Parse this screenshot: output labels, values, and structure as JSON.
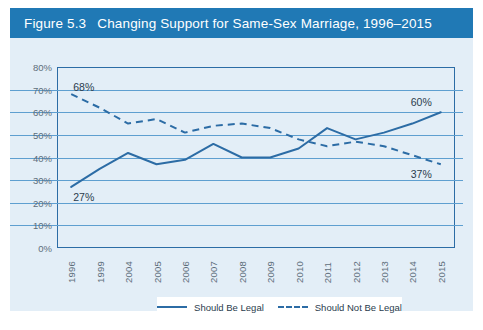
{
  "figure": {
    "number": "Figure 5.3",
    "title": "Changing Support for Same-Sex Marriage, 1996–2015",
    "title_bar_color": "#2079b5",
    "panel_bg_color": "#e3eef7",
    "accent_color": "#2c6ca5",
    "gridline_color": "#5e9fd0"
  },
  "chart_data": {
    "type": "line",
    "title": "Changing Support for Same-Sex Marriage, 1996–2015",
    "xlabel": "",
    "ylabel": "",
    "ylim": [
      0,
      80
    ],
    "ytick_labels": [
      "80%",
      "70%",
      "60%",
      "50%",
      "40%",
      "30%",
      "20%",
      "10%",
      "0%"
    ],
    "ytick_values": [
      80,
      70,
      60,
      50,
      40,
      30,
      20,
      10,
      0
    ],
    "grid": true,
    "legend_position": "bottom",
    "categories": [
      "1996",
      "1999",
      "2004",
      "2005",
      "2006",
      "2007",
      "2008",
      "2009",
      "2010",
      "2011",
      "2012",
      "2013",
      "2014",
      "2015"
    ],
    "series": [
      {
        "name": "Should Be Legal",
        "style": "solid",
        "color": "#2c6ca5",
        "values": [
          27,
          35,
          42,
          37,
          39,
          46,
          40,
          40,
          44,
          53,
          48,
          51,
          55,
          60
        ]
      },
      {
        "name": "Should Not Be Legal",
        "style": "dashed",
        "color": "#2c6ca5",
        "values": [
          68,
          62,
          55,
          57,
          51,
          54,
          55,
          53,
          48,
          45,
          47,
          45,
          41,
          37
        ]
      }
    ],
    "annotations": [
      {
        "text": "68%",
        "series": "Should Not Be Legal",
        "category": "1996",
        "value": 68
      },
      {
        "text": "27%",
        "series": "Should Be Legal",
        "category": "1996",
        "value": 27
      },
      {
        "text": "60%",
        "series": "Should Be Legal",
        "category": "2015",
        "value": 60
      },
      {
        "text": "37%",
        "series": "Should Not Be Legal",
        "category": "2015",
        "value": 37
      }
    ]
  },
  "legend": {
    "items": [
      {
        "label": "Should Be Legal",
        "style": "solid"
      },
      {
        "label": "Should Not Be Legal",
        "style": "dashed"
      }
    ]
  }
}
